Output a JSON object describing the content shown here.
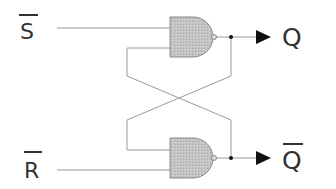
{
  "diagram": {
    "type": "SR latch (NAND)",
    "inputs": [
      {
        "name": "S",
        "overbar": true,
        "label": "S"
      },
      {
        "name": "R",
        "overbar": true,
        "label": "R"
      }
    ],
    "outputs": [
      {
        "name": "Q",
        "overbar": false,
        "label": "Q"
      },
      {
        "name": "Q_bar",
        "overbar": true,
        "label": "Q"
      }
    ],
    "gates": [
      {
        "id": "top-nand",
        "type": "NAND"
      },
      {
        "id": "bottom-nand",
        "type": "NAND"
      }
    ],
    "colors": {
      "wire": "#9a9a9a",
      "gate_fill": "#bdbdbd",
      "gate_stroke": "#8a8a8a",
      "text": "#333333",
      "arrow": "#111111"
    }
  }
}
